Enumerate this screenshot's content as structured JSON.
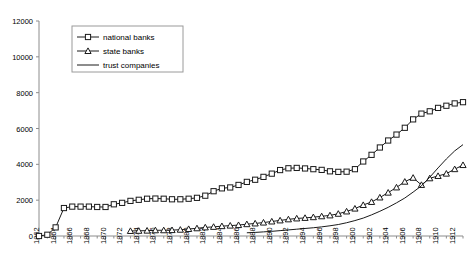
{
  "chart_data": {
    "type": "line",
    "title": "",
    "subtitle": "",
    "xlabel": "",
    "ylabel": "",
    "xlim": [
      1862,
      1913
    ],
    "ylim": [
      0,
      12000
    ],
    "grid": false,
    "legend_position": "top-left",
    "y_ticks": [
      0,
      2000,
      4000,
      6000,
      8000,
      10000,
      12000
    ],
    "y_tick_labels": [
      "0",
      "2000",
      "4000",
      "6000",
      "8000",
      "10000",
      "12000"
    ],
    "x_ticks": [
      1862,
      1864,
      1866,
      1868,
      1870,
      1872,
      1874,
      1876,
      1878,
      1880,
      1882,
      1884,
      1886,
      1888,
      1890,
      1892,
      1894,
      1896,
      1898,
      1900,
      1902,
      1904,
      1906,
      1908,
      1910,
      1912
    ],
    "x_tick_labels": [
      "1862",
      "1864",
      "1866",
      "1868",
      "1870",
      "1872",
      "1874",
      "1876",
      "1878",
      "1880",
      "1882",
      "1884",
      "1886",
      "1888",
      "1890",
      "1892",
      "1894",
      "1896",
      "1898",
      "1900",
      "1902",
      "1904",
      "1906",
      "1908",
      "1910",
      "1912"
    ],
    "legend": [
      "national banks",
      "state banks",
      "trust companies"
    ],
    "series": [
      {
        "name": "national banks",
        "marker": "square",
        "x": [
          1862,
          1863,
          1864,
          1865,
          1866,
          1867,
          1868,
          1869,
          1870,
          1871,
          1872,
          1873,
          1874,
          1875,
          1876,
          1877,
          1878,
          1879,
          1880,
          1881,
          1882,
          1883,
          1884,
          1885,
          1886,
          1887,
          1888,
          1889,
          1890,
          1891,
          1892,
          1893,
          1894,
          1895,
          1896,
          1897,
          1898,
          1899,
          1900,
          1901,
          1902,
          1903,
          1904,
          1905,
          1906,
          1907,
          1908,
          1909,
          1910,
          1911,
          1912,
          1913
        ],
        "values": [
          0,
          70,
          480,
          1560,
          1640,
          1640,
          1640,
          1620,
          1620,
          1770,
          1850,
          1960,
          2020,
          2080,
          2090,
          2080,
          2050,
          2050,
          2080,
          2130,
          2250,
          2500,
          2660,
          2710,
          2850,
          3020,
          3140,
          3300,
          3480,
          3680,
          3780,
          3800,
          3770,
          3730,
          3690,
          3610,
          3580,
          3590,
          3730,
          4160,
          4530,
          4940,
          5330,
          5660,
          6040,
          6510,
          6830,
          6960,
          7150,
          7270,
          7400,
          7470
        ],
        "endpoint_value": 7470
      },
      {
        "name": "state banks",
        "marker": "triangle",
        "x": [
          1873,
          1874,
          1875,
          1876,
          1877,
          1878,
          1879,
          1880,
          1881,
          1882,
          1883,
          1884,
          1885,
          1886,
          1887,
          1888,
          1889,
          1890,
          1891,
          1892,
          1893,
          1894,
          1895,
          1896,
          1897,
          1898,
          1899,
          1900,
          1901,
          1902,
          1903,
          1904,
          1905,
          1906,
          1907,
          1908,
          1909,
          1910,
          1911,
          1912,
          1913
        ],
        "values": [
          280,
          290,
          300,
          320,
          320,
          330,
          350,
          390,
          430,
          480,
          510,
          550,
          580,
          610,
          660,
          700,
          750,
          810,
          870,
          930,
          980,
          1010,
          1050,
          1100,
          1150,
          1240,
          1370,
          1530,
          1730,
          1900,
          2150,
          2420,
          2710,
          3030,
          3250,
          2850,
          3220,
          3350,
          3480,
          3730,
          3960
        ],
        "endpoint_value": 3960
      },
      {
        "name": "trust companies",
        "marker": "none",
        "x": [
          1887,
          1888,
          1889,
          1890,
          1891,
          1892,
          1893,
          1894,
          1895,
          1896,
          1897,
          1898,
          1899,
          1900,
          1901,
          1902,
          1903,
          1904,
          1905,
          1906,
          1907,
          1908,
          1909,
          1910,
          1911,
          1912,
          1913
        ],
        "values": [
          180,
          200,
          230,
          260,
          300,
          340,
          380,
          420,
          460,
          510,
          570,
          640,
          740,
          860,
          1000,
          1180,
          1380,
          1600,
          1850,
          2120,
          2450,
          2800,
          3280,
          3800,
          4300,
          4750,
          5100
        ],
        "endpoint_value": 5100
      }
    ]
  },
  "legend": {
    "items": [
      {
        "label": "national banks",
        "marker": "square"
      },
      {
        "label": "state banks",
        "marker": "triangle"
      },
      {
        "label": "trust companies",
        "marker": "line"
      }
    ]
  },
  "colors": {
    "series_stroke": "#1a1a1a",
    "axis": "#8c8c8c",
    "legend_border": "#9a9a9a",
    "background": "#ffffff"
  }
}
